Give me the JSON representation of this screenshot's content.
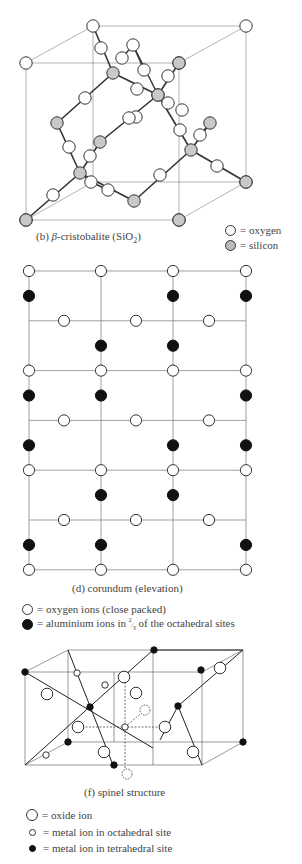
{
  "panels": {
    "cristobalite": {
      "caption_prefix": "(b) ",
      "caption_greek": "β",
      "caption_main": "-cristobalite (SiO",
      "caption_sub": "2",
      "caption_end": ")",
      "legend": [
        {
          "symbol": "open-circle",
          "text": "= oxygen"
        },
        {
          "symbol": "shaded-circle",
          "text": "= silicon"
        }
      ]
    },
    "corundum": {
      "caption": "(d) corundum (elevation)",
      "legend": [
        {
          "symbol": "open-circle",
          "text": "= oxygen ions (close packed)"
        },
        {
          "symbol": "filled-circle",
          "text_pre": "= aluminium ions in ",
          "fraction_num": "2",
          "fraction_den": "3",
          "text_post": " of the octahedral sites"
        }
      ],
      "pattern": {
        "rows": [
          {
            "kind": "O-full"
          },
          {
            "kind": "Al",
            "cols": [
              0,
              2,
              3
            ]
          },
          {
            "kind": "O-mid"
          },
          {
            "kind": "Al",
            "cols": [
              1,
              2
            ]
          },
          {
            "kind": "O-full"
          },
          {
            "kind": "Al",
            "cols": [
              0,
              1,
              3
            ]
          },
          {
            "kind": "O-mid"
          },
          {
            "kind": "Al",
            "cols": [
              0,
              2,
              3
            ]
          },
          {
            "kind": "O-full"
          },
          {
            "kind": "Al",
            "cols": [
              1,
              2
            ]
          },
          {
            "kind": "O-mid"
          },
          {
            "kind": "Al",
            "cols": [
              0,
              1,
              3
            ]
          },
          {
            "kind": "O-full"
          }
        ]
      }
    },
    "spinel": {
      "caption": "(f) spinel structure",
      "legend": [
        {
          "symbol": "large-open-circle",
          "text": "= oxide ion"
        },
        {
          "symbol": "small-open-circle",
          "text": "= metal ion in octahedral site"
        },
        {
          "symbol": "small-filled-circle",
          "text": "= metal ion in tetrahedral site"
        }
      ]
    }
  }
}
